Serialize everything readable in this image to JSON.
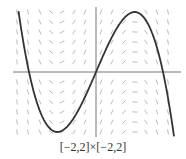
{
  "chart_data": {
    "type": "line",
    "subtype": "slope-field-with-solution-curve",
    "title": "",
    "caption": "[−2,2]×[−2,2]",
    "xlabel": "",
    "ylabel": "",
    "xlim": [
      -2,
      2
    ],
    "ylim": [
      -2,
      2
    ],
    "grid": false,
    "axes": {
      "x_axis_at": 0,
      "y_axis_at": 0
    },
    "slope_field": {
      "columns": 15,
      "rows": 13,
      "slope_depends_on": "x",
      "pattern": "steep positive near x=±2, horizontal near x≈±1.15, negative near x=0"
    },
    "series": [
      {
        "name": "solution curve",
        "description": "cubic with roots at x≈−2, 0, 2; local max ≈ (−1.15, 1.8); local min ≈ (1.15, −1.8)",
        "x": [
          -2.2,
          -2.0,
          -1.5,
          -1.15,
          -0.5,
          0,
          0.5,
          1.15,
          1.5,
          2.0,
          2.3
        ],
        "y": [
          -1.9,
          0,
          1.6,
          1.8,
          1.1,
          0,
          -1.1,
          -1.8,
          -1.6,
          0,
          1.9
        ]
      }
    ]
  },
  "colors": {
    "curve": "#333333",
    "axis": "#777777",
    "slope_marks": "#aaaaaa"
  }
}
